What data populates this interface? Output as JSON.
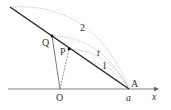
{
  "diagram": {
    "type": "geometry",
    "colors": {
      "line": "#222222",
      "thin_line": "#555555",
      "dotted": "#999999",
      "axis": "#666666",
      "text": "#333333"
    },
    "points": {
      "Q": {
        "label": "Q",
        "x": 52,
        "y": 36
      },
      "P": {
        "label": "P",
        "x": 69,
        "y": 49
      },
      "A": {
        "label": "A",
        "x": 129,
        "y": 89
      },
      "O": {
        "label": "O",
        "x": 60,
        "y": 89
      }
    },
    "labels": {
      "Q": "Q",
      "P": "P",
      "A": "A",
      "O": "O",
      "a": "a",
      "x_axis": "x",
      "arc_2": "2",
      "arc_t": "t",
      "arc_1": "1"
    }
  }
}
